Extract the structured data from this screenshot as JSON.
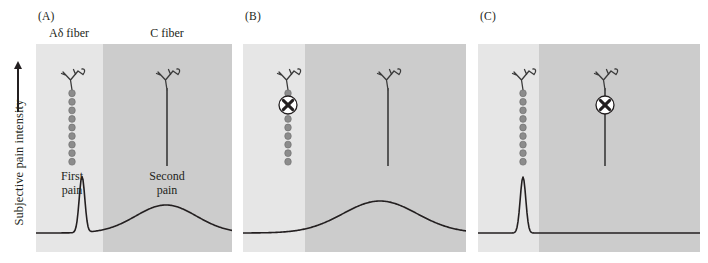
{
  "figure": {
    "axis": {
      "y_label": "Subjective pain intensity",
      "arrow_icon": "up-arrow-icon"
    },
    "panels": [
      {
        "tag": "(A)",
        "left": 36,
        "width": 196,
        "split": 67,
        "col_titles": [
          {
            "text": "Aδ fiber",
            "cx": 33
          },
          {
            "text": "C fiber",
            "cx": 131
          }
        ],
        "fibers": [
          {
            "type": "myelinated",
            "name": "a-delta-fiber",
            "cx": 36,
            "top": 24,
            "bottom": 122,
            "blocked": false
          },
          {
            "type": "unmyelinated",
            "name": "c-fiber",
            "cx": 131,
            "top": 24,
            "bottom": 122,
            "blocked": false
          }
        ],
        "pain_labels": [
          {
            "text": "First\npain",
            "cx": 36,
            "top": 126
          },
          {
            "text": "Second\npain",
            "cx": 131,
            "top": 126
          }
        ],
        "trace": {
          "baseline": 189,
          "spike": {
            "present": true,
            "cx": 46,
            "peak_height": 56,
            "halfwidth": 5
          },
          "hump": {
            "present": true,
            "cx": 130,
            "peak_height": 28,
            "halfwidth": 46
          }
        }
      },
      {
        "tag": "(B)",
        "left": 243,
        "width": 223,
        "split": 62,
        "col_titles": [],
        "fibers": [
          {
            "type": "myelinated",
            "name": "a-delta-fiber",
            "cx": 45,
            "top": 24,
            "bottom": 122,
            "blocked": true,
            "block_y": 61
          },
          {
            "type": "unmyelinated",
            "name": "c-fiber",
            "cx": 145,
            "top": 24,
            "bottom": 122,
            "blocked": false
          }
        ],
        "pain_labels": [],
        "trace": {
          "baseline": 189,
          "spike": {
            "present": false,
            "cx": 0,
            "peak_height": 0,
            "halfwidth": 0
          },
          "hump": {
            "present": true,
            "cx": 137,
            "peak_height": 32,
            "halfwidth": 56
          }
        }
      },
      {
        "tag": "(C)",
        "left": 478,
        "width": 222,
        "split": 61,
        "col_titles": [],
        "fibers": [
          {
            "type": "myelinated",
            "name": "a-delta-fiber",
            "cx": 45,
            "top": 24,
            "bottom": 122,
            "blocked": false
          },
          {
            "type": "unmyelinated",
            "name": "c-fiber",
            "cx": 127,
            "top": 24,
            "bottom": 122,
            "blocked": true,
            "block_y": 61
          }
        ],
        "pain_labels": [],
        "trace": {
          "baseline": 189,
          "spike": {
            "present": true,
            "cx": 45,
            "peak_height": 56,
            "halfwidth": 5
          },
          "hump": {
            "present": false,
            "cx": 0,
            "peak_height": 0,
            "halfwidth": 0
          }
        }
      }
    ],
    "colors": {
      "panel_light": "#e6e6e6",
      "panel_dark": "#cccccc",
      "fiber_myelin": "#8c8c8c",
      "fiber_stroke": "#3a3a3a",
      "trace": "#231f20",
      "text": "#231f20",
      "block_marker_fill": "#ffffff"
    },
    "block_marker": {
      "icon": "circled-x-icon",
      "glyph": "X",
      "radius": 9
    }
  }
}
